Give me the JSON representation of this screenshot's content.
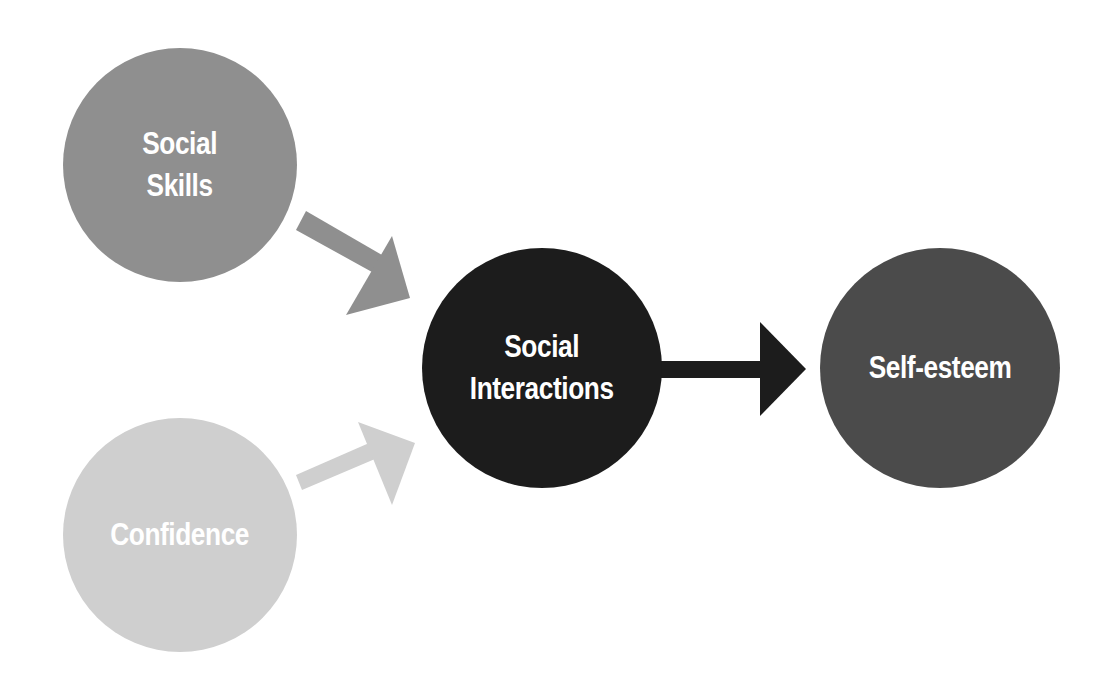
{
  "diagram": {
    "type": "causal-flow",
    "nodes": [
      {
        "id": "social-skills",
        "lines": [
          "Social",
          "Skills"
        ],
        "color": "#8f8f8f"
      },
      {
        "id": "confidence",
        "lines": [
          "Confidence"
        ],
        "color": "#cfcfcf"
      },
      {
        "id": "social-interactions",
        "lines": [
          "Social",
          "Interactions"
        ],
        "color": "#1c1c1c"
      },
      {
        "id": "self-esteem",
        "lines": [
          "Self-esteem"
        ],
        "color": "#4b4b4b"
      }
    ],
    "edges": [
      {
        "from": "social-skills",
        "to": "social-interactions",
        "color": "#8f8f8f"
      },
      {
        "from": "confidence",
        "to": "social-interactions",
        "color": "#cfcfcf"
      },
      {
        "from": "social-interactions",
        "to": "self-esteem",
        "color": "#1c1c1c"
      }
    ]
  }
}
